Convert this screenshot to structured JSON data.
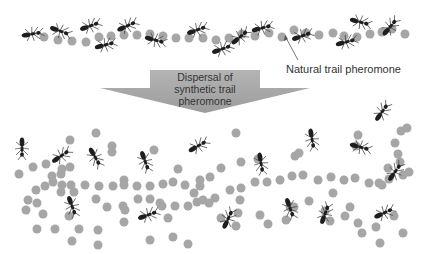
{
  "labels": {
    "natural_trail": "Natural trail pheromone",
    "arrow_line1": "Dispersal of",
    "arrow_line2": "synthetic trail pheromone"
  },
  "colors": {
    "pheromone_dot": "#a6a6a6",
    "ant": "#1e1e1e",
    "arrow_fill": "#a9a9a9",
    "background": "#ffffff"
  },
  "icons": {
    "ant": "ant-icon",
    "pheromone": "pheromone-dot-icon",
    "arrow": "down-arrow-icon"
  },
  "top_trail": {
    "dots": [
      [
        44,
        37
      ],
      [
        58,
        40
      ],
      [
        72,
        41
      ],
      [
        86,
        42
      ],
      [
        99,
        37
      ],
      [
        111,
        36
      ],
      [
        124,
        35
      ],
      [
        137,
        35
      ],
      [
        150,
        34
      ],
      [
        163,
        36
      ],
      [
        176,
        38
      ],
      [
        189,
        38
      ],
      [
        203,
        38
      ],
      [
        216,
        40
      ],
      [
        229,
        38
      ],
      [
        242,
        34
      ],
      [
        255,
        36
      ],
      [
        269,
        33
      ],
      [
        282,
        37
      ],
      [
        294,
        30
      ],
      [
        306,
        33
      ],
      [
        319,
        35
      ],
      [
        333,
        33
      ],
      [
        344,
        36
      ],
      [
        357,
        37
      ],
      [
        370,
        34
      ],
      [
        382,
        32
      ],
      [
        392,
        29
      ],
      [
        405,
        34
      ]
    ],
    "ants": [
      [
        32,
        34,
        -10
      ],
      [
        60,
        31,
        20
      ],
      [
        90,
        26,
        -20
      ],
      [
        127,
        26,
        -25
      ],
      [
        105,
        45,
        -15
      ],
      [
        155,
        40,
        15
      ],
      [
        197,
        30,
        -20
      ],
      [
        222,
        49,
        -20
      ],
      [
        240,
        37,
        -40
      ],
      [
        262,
        28,
        -15
      ],
      [
        302,
        36,
        -20
      ],
      [
        346,
        42,
        -15
      ],
      [
        360,
        22,
        15
      ],
      [
        390,
        27,
        -50
      ]
    ]
  },
  "scatter": {
    "dots": [
      [
        96,
        133
      ],
      [
        70,
        140
      ],
      [
        112,
        146
      ],
      [
        112,
        152
      ],
      [
        33,
        167
      ],
      [
        46,
        164
      ],
      [
        62,
        169
      ],
      [
        70,
        167
      ],
      [
        19,
        174
      ],
      [
        52,
        176
      ],
      [
        61,
        174
      ],
      [
        36,
        190
      ],
      [
        45,
        186
      ],
      [
        53,
        182
      ],
      [
        62,
        185
      ],
      [
        71,
        185
      ],
      [
        85,
        185
      ],
      [
        99,
        186
      ],
      [
        113,
        186
      ],
      [
        124,
        185
      ],
      [
        137,
        186
      ],
      [
        150,
        186
      ],
      [
        163,
        184
      ],
      [
        173,
        182
      ],
      [
        185,
        185
      ],
      [
        200,
        186
      ],
      [
        124,
        180
      ],
      [
        178,
        169
      ],
      [
        200,
        180
      ],
      [
        210,
        177
      ],
      [
        221,
        168
      ],
      [
        241,
        162
      ],
      [
        258,
        159
      ],
      [
        28,
        200
      ],
      [
        37,
        203
      ],
      [
        61,
        192
      ],
      [
        74,
        192
      ],
      [
        96,
        199
      ],
      [
        107,
        207
      ],
      [
        123,
        206
      ],
      [
        138,
        199
      ],
      [
        150,
        199
      ],
      [
        162,
        206
      ],
      [
        175,
        206
      ],
      [
        188,
        206
      ],
      [
        197,
        202
      ],
      [
        209,
        203
      ],
      [
        215,
        198
      ],
      [
        230,
        190
      ],
      [
        241,
        188
      ],
      [
        255,
        182
      ],
      [
        267,
        182
      ],
      [
        280,
        180
      ],
      [
        292,
        176
      ],
      [
        303,
        175
      ],
      [
        318,
        180
      ],
      [
        331,
        177
      ],
      [
        344,
        180
      ],
      [
        355,
        178
      ],
      [
        369,
        183
      ],
      [
        379,
        183
      ],
      [
        389,
        179
      ],
      [
        403,
        175
      ],
      [
        409,
        172
      ],
      [
        400,
        162
      ],
      [
        398,
        154
      ],
      [
        395,
        143
      ],
      [
        401,
        131
      ],
      [
        407,
        128
      ],
      [
        358,
        135
      ],
      [
        356,
        146
      ],
      [
        388,
        168
      ],
      [
        382,
        185
      ],
      [
        26,
        210
      ],
      [
        43,
        214
      ],
      [
        37,
        229
      ],
      [
        55,
        229
      ],
      [
        69,
        216
      ],
      [
        79,
        229
      ],
      [
        98,
        230
      ],
      [
        125,
        210
      ],
      [
        160,
        203
      ],
      [
        168,
        218
      ],
      [
        173,
        237
      ],
      [
        194,
        193
      ],
      [
        203,
        200
      ],
      [
        221,
        218
      ],
      [
        238,
        213
      ],
      [
        236,
        226
      ],
      [
        240,
        200
      ],
      [
        260,
        215
      ],
      [
        268,
        224
      ],
      [
        286,
        220
      ],
      [
        290,
        207
      ],
      [
        309,
        201
      ],
      [
        325,
        211
      ],
      [
        333,
        193
      ],
      [
        330,
        221
      ],
      [
        345,
        216
      ],
      [
        350,
        207
      ],
      [
        358,
        223
      ],
      [
        362,
        233
      ],
      [
        376,
        227
      ],
      [
        380,
        243
      ],
      [
        394,
        216
      ],
      [
        403,
        233
      ],
      [
        295,
        156
      ],
      [
        299,
        153
      ],
      [
        236,
        133
      ],
      [
        154,
        150
      ],
      [
        124,
        222
      ],
      [
        98,
        245
      ],
      [
        72,
        241
      ],
      [
        150,
        240
      ],
      [
        188,
        244
      ],
      [
        294,
        207
      ]
    ],
    "ants": [
      [
        22,
        148,
        90
      ],
      [
        61,
        156,
        -35
      ],
      [
        95,
        157,
        60
      ],
      [
        145,
        161,
        70
      ],
      [
        198,
        146,
        -30
      ],
      [
        261,
        163,
        80
      ],
      [
        312,
        139,
        80
      ],
      [
        360,
        147,
        15
      ],
      [
        382,
        112,
        -55
      ],
      [
        395,
        172,
        -55
      ],
      [
        72,
        206,
        70
      ],
      [
        148,
        215,
        -20
      ],
      [
        228,
        219,
        -65
      ],
      [
        290,
        208,
        70
      ],
      [
        325,
        214,
        -70
      ],
      [
        384,
        213,
        -25
      ]
    ]
  }
}
